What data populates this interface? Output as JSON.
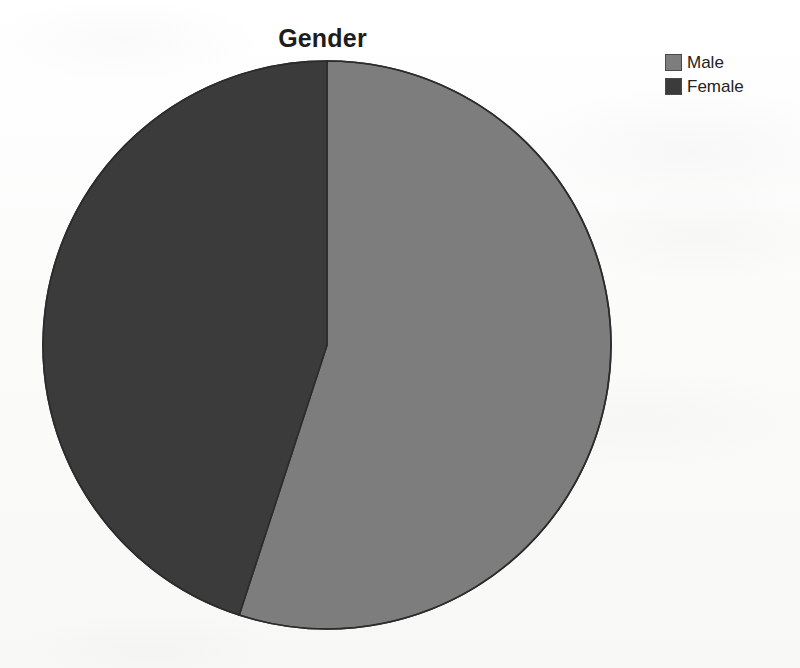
{
  "chart_data": {
    "type": "pie",
    "title": "Gender",
    "categories": [
      "Male",
      "Female"
    ],
    "values": [
      55,
      45
    ],
    "value_unit": "percent",
    "slices": [
      {
        "label": "Male",
        "value": 55,
        "color": "#7d7d7d",
        "start_angle_deg": 0,
        "end_angle_deg": 199
      },
      {
        "label": "Female",
        "value": 45,
        "color": "#3b3b3b",
        "start_angle_deg": 199,
        "end_angle_deg": 360
      }
    ],
    "legend": {
      "position": "top-right",
      "entries": [
        {
          "label": "Male",
          "color": "#7d7d7d"
        },
        {
          "label": "Female",
          "color": "#3b3b3b"
        }
      ]
    },
    "xlabel": "",
    "ylabel": "",
    "grid": false,
    "start_angle": "12 o'clock",
    "direction": "clockwise",
    "data_labels_shown": false
  },
  "colors": {
    "background": "#fbfbfb",
    "title_text": "#1d1d1d",
    "legend_text": "#232323",
    "slice_outline": "#2c2c2c",
    "male": "#7d7d7d",
    "female": "#3b3b3b"
  }
}
